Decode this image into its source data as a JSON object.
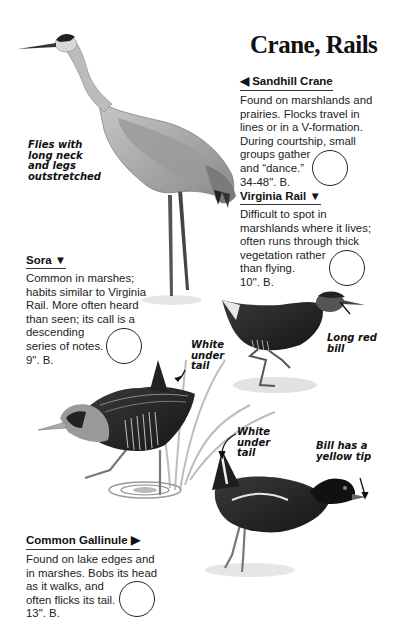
{
  "page": {
    "title": "Crane, Rails"
  },
  "entries": {
    "sandhill_crane": {
      "name": "Sandhill Crane",
      "pointer": "◀",
      "pointer_position": "before",
      "lines": [
        "Found on marshlands and",
        "prairies. Flocks travel in",
        "lines or in a V-formation.",
        "During courtship, small",
        "groups gather",
        "and “dance.”",
        "34-48\". B."
      ],
      "checkbox": "empty-circle"
    },
    "virginia_rail": {
      "name": "Virginia Rail",
      "pointer": "▼",
      "pointer_position": "after",
      "lines": [
        "Difficult to spot in",
        "marshlands where it lives;",
        "often runs through thick",
        "vegetation rather",
        "than flying.",
        "10\". B."
      ],
      "checkbox": "empty-circle"
    },
    "sora": {
      "name": "Sora",
      "pointer": "▼",
      "pointer_position": "after",
      "lines": [
        "Common in marshes;",
        "habits similar to Virginia",
        "Rail. More often heard",
        "than seen; its call is a",
        "descending",
        "series of notes.",
        "9\". B."
      ],
      "checkbox": "empty-circle"
    },
    "common_gallinule": {
      "name": "Common Gallinule",
      "pointer": "▶",
      "pointer_position": "after",
      "lines": [
        "Found on lake edges and",
        "in marshes. Bobs its head",
        "as it walks, and",
        "often flicks its tail.",
        "13\". B."
      ],
      "checkbox": "empty-circle"
    }
  },
  "annotations": {
    "crane_flight": [
      "Flies with",
      "long neck",
      "and legs",
      "outstretched"
    ],
    "sora_tail": [
      "White",
      "under",
      "tail"
    ],
    "rail_bill": [
      "Long red",
      "bill"
    ],
    "gallinule_tail": [
      "White",
      "under",
      "tail"
    ],
    "gallinule_bill": [
      "Bill has a",
      "yellow tip"
    ]
  },
  "illustrations": [
    {
      "name": "sandhill-crane",
      "palette": "grayscale"
    },
    {
      "name": "virginia-rail",
      "palette": "grayscale"
    },
    {
      "name": "sora",
      "palette": "grayscale"
    },
    {
      "name": "common-gallinule",
      "palette": "grayscale"
    }
  ]
}
